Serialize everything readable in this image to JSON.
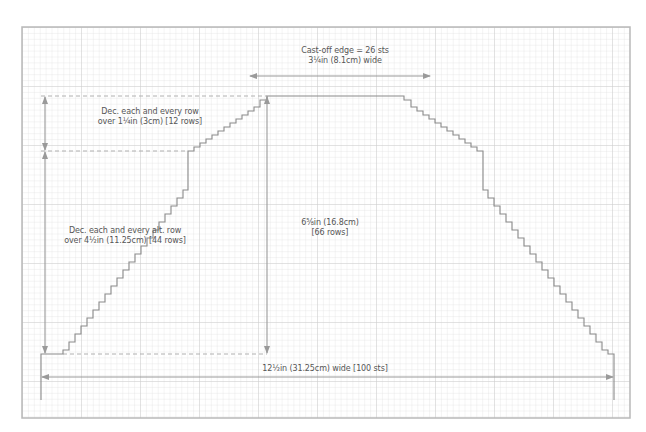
{
  "diagram": {
    "type": "knitting-chart-trapezoid",
    "colors": {
      "grid_minor": "#e4e4e4",
      "grid_major": "#cfcfcf",
      "frame": "#b9b9b9",
      "outline": "#8a8a8a",
      "arrow": "#9a9a9a",
      "dashed": "#b0b0b0",
      "text": "#555555"
    },
    "labels": {
      "cast_off_line1": "Cast-off edge = 26 sts",
      "cast_off_line2": "3¼in (8.1cm) wide",
      "dec_every_row_line1": "Dec. each and every row",
      "dec_every_row_line2": "over 1¼in (3cm) [12 rows]",
      "dec_alt_row_line1": "Dec. each and every alt. row",
      "dec_alt_row_line2": "over 4½in (11.25cm) [44 rows]",
      "height_line1": "6⅝in (16.8cm)",
      "height_line2": "[66 rows]",
      "width": "12½in (31.25cm) wide [100 sts]"
    },
    "measurements": {
      "cast_on_sts": 100,
      "cast_off_sts": 26,
      "total_rows": 66,
      "every_row_dec_rows": 12,
      "alt_row_dec_rows": 44
    }
  }
}
